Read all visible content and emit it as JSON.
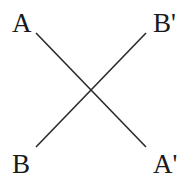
{
  "diagram": {
    "labels": {
      "top_left": "A",
      "top_right": "B'",
      "bottom_left": "B",
      "bottom_right": "A'"
    },
    "lines": [
      {
        "name": "A to A'",
        "from": "A",
        "to": "A'"
      },
      {
        "name": "B to B'",
        "from": "B",
        "to": "B'"
      }
    ],
    "colors": {
      "line": "#2a2a2a",
      "text": "#1a1a1a",
      "background": "#ffffff"
    }
  }
}
